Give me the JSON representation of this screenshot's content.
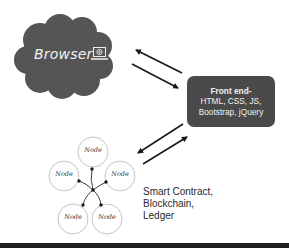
{
  "browser": {
    "label": "Browser",
    "icon": "laptop-globe-icon",
    "cloud_color": "#555555"
  },
  "frontend": {
    "title": "Front end-",
    "lines": [
      "HTML, CSS, JS,",
      "Bootstrap, jQuery"
    ],
    "box_color": "#4a4a4a"
  },
  "network": {
    "node_label": "Node",
    "nodes": [
      {
        "label": "Node",
        "position": "top"
      },
      {
        "label": "Node",
        "position": "left"
      },
      {
        "label": "Node",
        "position": "right"
      },
      {
        "label": "Node",
        "position": "bottom-left"
      },
      {
        "label": "Node",
        "position": "bottom-right"
      }
    ]
  },
  "backend": {
    "lines": [
      "Smart Contract,",
      "Blockchain,",
      "Ledger"
    ]
  },
  "arrows": [
    {
      "from": "frontend",
      "to": "browser"
    },
    {
      "from": "browser",
      "to": "frontend"
    },
    {
      "from": "frontend",
      "to": "network"
    },
    {
      "from": "network",
      "to": "frontend"
    }
  ]
}
